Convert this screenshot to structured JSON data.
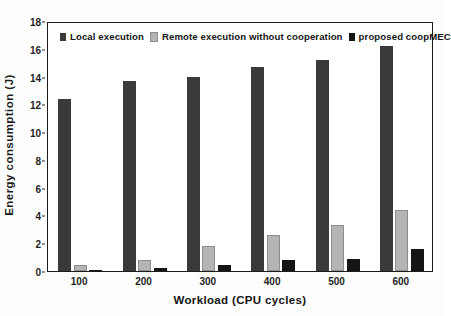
{
  "chart_data": {
    "type": "bar",
    "title": "",
    "xlabel": "Workload (CPU cycles)",
    "ylabel": "Energy consumption (J)",
    "categories": [
      "100",
      "200",
      "300",
      "400",
      "500",
      "600"
    ],
    "ylim": [
      0,
      18
    ],
    "yticks": [
      0,
      2,
      4,
      6,
      8,
      10,
      12,
      14,
      16,
      18
    ],
    "ytick_labels": [
      "0",
      "2",
      "4",
      "6",
      "8",
      "10",
      "12",
      "14",
      "16",
      "18"
    ],
    "grid": false,
    "legend_position": "top-inside",
    "series": [
      {
        "name": "Local execution",
        "color": "#3a3a3a",
        "values": [
          12.4,
          13.7,
          14.0,
          14.7,
          15.2,
          16.2
        ]
      },
      {
        "name": "Remote execution without cooperation",
        "color": "#b4b4b4",
        "values": [
          0.4,
          0.8,
          1.8,
          2.6,
          3.3,
          4.4
        ]
      },
      {
        "name": "proposed coopMEC",
        "color": "#141414",
        "values": [
          0.1,
          0.2,
          0.4,
          0.8,
          0.9,
          1.6
        ]
      }
    ]
  },
  "legend": {
    "items": [
      {
        "label": "Local execution",
        "marker": "square-swatch-dark"
      },
      {
        "label": "Remote execution without cooperation",
        "marker": "square-swatch-gray"
      },
      {
        "label": "proposed coopMEC",
        "marker": "square-swatch-black"
      }
    ]
  },
  "axes": {
    "y_title": "Energy consumption (J)",
    "x_title": "Workload (CPU cycles)"
  }
}
